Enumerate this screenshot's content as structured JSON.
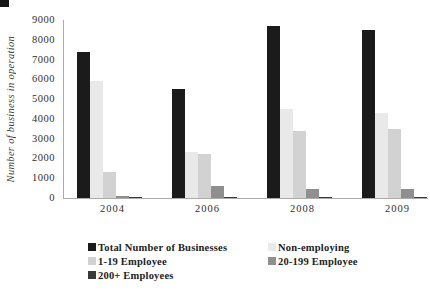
{
  "decorations": {
    "top_left_mark_color": "#161616"
  },
  "chart_data": {
    "type": "bar",
    "title": "",
    "xlabel": "",
    "ylabel": "Number of business in operation",
    "categories": [
      "2004",
      "2006",
      "2008",
      "2009"
    ],
    "series": [
      {
        "name": "Total Number of Businesses",
        "color": "#1b1b1b",
        "values": [
          7400,
          5500,
          8700,
          8500
        ]
      },
      {
        "name": "Non-employing",
        "color": "#e9e9e9",
        "values": [
          5900,
          2350,
          4500,
          4300
        ]
      },
      {
        "name": "1-19 Employee",
        "color": "#d2d2d2",
        "values": [
          1300,
          2200,
          3400,
          3500
        ]
      },
      {
        "name": "20-199 Employee",
        "color": "#8f8f8f",
        "values": [
          100,
          600,
          450,
          450
        ]
      },
      {
        "name": "200+ Employees",
        "color": "#3a3a3a",
        "values": [
          20,
          50,
          50,
          30
        ]
      }
    ],
    "ylim": [
      0,
      9000
    ],
    "yticks": [
      0,
      1000,
      2000,
      3000,
      4000,
      5000,
      6000,
      7000,
      8000,
      9000
    ],
    "grid": false,
    "legend_position": "bottom"
  }
}
